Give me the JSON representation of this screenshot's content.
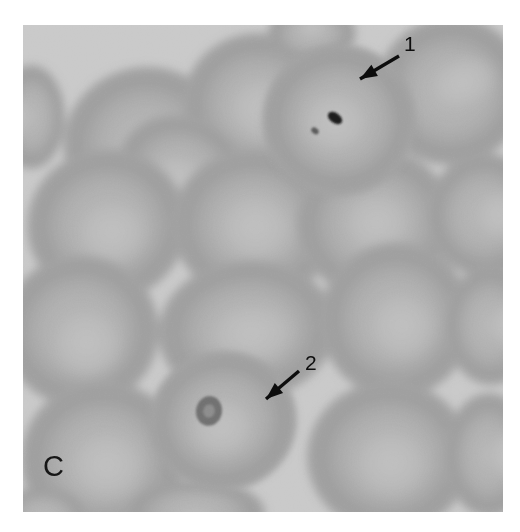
{
  "figure": {
    "panel_letter": "C",
    "modality": "light-microscopy-blood-smear",
    "background_color": "#ffffff",
    "plasma_color": "#c9c9c9",
    "cell_color": "#a6a6a6",
    "cell_rim_color": "#9a9a9a",
    "pallor_color": "#bdbdbd",
    "parasite_color": "#1c1c1c",
    "annotation_color": "#0d0d0d"
  },
  "annotations": [
    {
      "id": "arrow-1",
      "label": "1",
      "label_x": 404,
      "label_y": 33,
      "tail_x": 399,
      "tail_y": 56,
      "head_x": 360,
      "head_y": 79,
      "points_to": "infected-erythrocyte-with-dark-pigment-inclusion"
    },
    {
      "id": "arrow-2",
      "label": "2",
      "label_x": 305,
      "label_y": 352,
      "tail_x": 299,
      "tail_y": 371,
      "head_x": 266,
      "head_y": 399,
      "points_to": "infected-erythrocyte-with-ring-form"
    }
  ],
  "chart_data": {
    "type": "scatter",
    "title": "",
    "xlabel": "",
    "ylabel": "",
    "note": "Coordinates are in micrograph-frame pixel space (480 x 487), origin top-left.",
    "categories": [
      "erythrocyte",
      "infected-erythrocyte"
    ],
    "series": [
      {
        "name": "erythrocyte",
        "cells": [
          {
            "cx": 122,
            "cy": 118,
            "rx": 82,
            "ry": 76,
            "rot": -12,
            "pallor_dx": 6,
            "pallor_dy": 10,
            "pallor_rx": 44,
            "pallor_ry": 40
          },
          {
            "cx": 8,
            "cy": 92,
            "rx": 34,
            "ry": 52,
            "rot": 0,
            "pallor_dx": -12,
            "pallor_dy": 0,
            "pallor_rx": 14,
            "pallor_ry": 24
          },
          {
            "cx": 237,
            "cy": 80,
            "rx": 77,
            "ry": 72,
            "rot": 8,
            "pallor_dx": 4,
            "pallor_dy": 4,
            "pallor_rx": 42,
            "pallor_ry": 38
          },
          {
            "cx": 289,
            "cy": 8,
            "rx": 44,
            "ry": 30,
            "rot": 0,
            "pallor_dx": 0,
            "pallor_dy": -6,
            "pallor_rx": 20,
            "pallor_ry": 10
          },
          {
            "cx": 428,
            "cy": 66,
            "rx": 76,
            "ry": 74,
            "rot": -20,
            "pallor_dx": 14,
            "pallor_dy": -4,
            "pallor_rx": 40,
            "pallor_ry": 30
          },
          {
            "cx": 160,
            "cy": 150,
            "rx": 68,
            "ry": 58,
            "rot": 28,
            "pallor_dx": 0,
            "pallor_dy": 4,
            "pallor_rx": 36,
            "pallor_ry": 26
          },
          {
            "cx": 84,
            "cy": 200,
            "rx": 80,
            "ry": 76,
            "rot": -8,
            "pallor_dx": 4,
            "pallor_dy": 8,
            "pallor_rx": 42,
            "pallor_ry": 38
          },
          {
            "cx": 231,
            "cy": 200,
            "rx": 82,
            "ry": 76,
            "rot": 4,
            "pallor_dx": 2,
            "pallor_dy": 2,
            "pallor_rx": 44,
            "pallor_ry": 40
          },
          {
            "cx": 352,
            "cy": 198,
            "rx": 79,
            "ry": 74,
            "rot": -6,
            "pallor_dx": 2,
            "pallor_dy": 0,
            "pallor_rx": 40,
            "pallor_ry": 36
          },
          {
            "cx": 462,
            "cy": 190,
            "rx": 58,
            "ry": 62,
            "rot": 0,
            "pallor_dx": 14,
            "pallor_dy": 0,
            "pallor_rx": 26,
            "pallor_ry": 30
          },
          {
            "cx": 58,
            "cy": 306,
            "rx": 78,
            "ry": 76,
            "rot": 0,
            "pallor_dx": 6,
            "pallor_dy": 12,
            "pallor_rx": 42,
            "pallor_ry": 40
          },
          {
            "cx": 224,
            "cy": 305,
            "rx": 89,
            "ry": 70,
            "rot": -6,
            "pallor_dx": 4,
            "pallor_dy": 4,
            "pallor_rx": 50,
            "pallor_ry": 36
          },
          {
            "cx": 373,
            "cy": 295,
            "rx": 76,
            "ry": 78,
            "rot": 0,
            "pallor_dx": 6,
            "pallor_dy": 6,
            "pallor_rx": 40,
            "pallor_ry": 40
          },
          {
            "cx": 468,
            "cy": 300,
            "rx": 46,
            "ry": 60,
            "rot": 0,
            "pallor_dx": 16,
            "pallor_dy": 0,
            "pallor_rx": 20,
            "pallor_ry": 28
          },
          {
            "cx": 80,
            "cy": 434,
            "rx": 82,
            "ry": 78,
            "rot": 0,
            "pallor_dx": 4,
            "pallor_dy": 6,
            "pallor_rx": 44,
            "pallor_ry": 40
          },
          {
            "cx": 366,
            "cy": 432,
            "rx": 82,
            "ry": 76,
            "rot": 0,
            "pallor_dx": 2,
            "pallor_dy": 6,
            "pallor_rx": 44,
            "pallor_ry": 40
          },
          {
            "cx": 466,
            "cy": 430,
            "rx": 44,
            "ry": 62,
            "rot": 0,
            "pallor_dx": 16,
            "pallor_dy": 0,
            "pallor_rx": 18,
            "pallor_ry": 28
          },
          {
            "cx": 172,
            "cy": 488,
            "rx": 70,
            "ry": 34,
            "rot": 0,
            "pallor_dx": 0,
            "pallor_dy": 10,
            "pallor_rx": 34,
            "pallor_ry": 14
          },
          {
            "cx": 20,
            "cy": 492,
            "rx": 44,
            "ry": 30,
            "rot": 0,
            "pallor_dx": 0,
            "pallor_dy": 10,
            "pallor_rx": 18,
            "pallor_ry": 10
          }
        ]
      },
      {
        "name": "infected-erythrocyte",
        "cells": [
          {
            "cx": 316,
            "cy": 95,
            "rx": 77,
            "ry": 76,
            "rot": 0,
            "pallor_dx": -4,
            "pallor_dy": 2,
            "pallor_rx": 40,
            "pallor_ry": 36,
            "marker": "1",
            "inclusion": {
              "dx": -4,
              "dy": -2,
              "rx": 8,
              "ry": 5,
              "rot": 35,
              "fill": "#1c1c1c"
            }
          },
          {
            "cx": 200,
            "cy": 396,
            "rx": 74,
            "ry": 70,
            "rot": -10,
            "pallor_dx": -2,
            "pallor_dy": 6,
            "pallor_rx": 38,
            "pallor_ry": 34,
            "marker": "2",
            "inclusion": {
              "dx": -14,
              "dy": -10,
              "rx": 13,
              "ry": 15,
              "rot": 10,
              "fill": "#6f6f6f"
            }
          }
        ]
      }
    ]
  }
}
